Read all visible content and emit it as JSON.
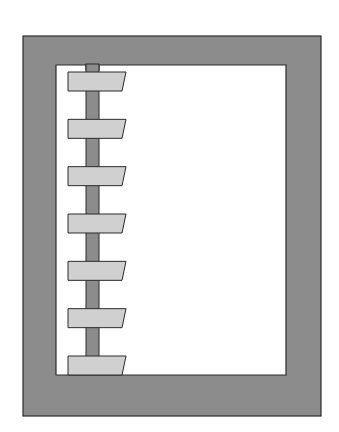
{
  "figure": {
    "tab_count": 7,
    "colors": {
      "background": "#ffffff",
      "frame": "#8c8c8c",
      "page": "#ffffff",
      "spine": "#8c8c8c",
      "tab": "#d0d0d0",
      "outline": "#2a2a2a"
    }
  }
}
